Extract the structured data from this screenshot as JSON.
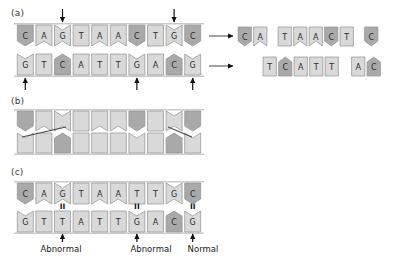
{
  "figure": {
    "panels": [
      {
        "id": "a",
        "label": "(a)"
      },
      {
        "id": "b",
        "label": "(b)"
      },
      {
        "id": "c",
        "label": "(c)"
      }
    ],
    "colors": {
      "tile_dark": "#a9a9a9",
      "tile_light": "#d9d9d9",
      "tile_stroke": "#8f8f8f",
      "backbone": "#c9c9c9",
      "arrow": "#111111",
      "text": "#1a1a1a"
    }
  },
  "panel_a": {
    "label": "(a)",
    "top_strand": {
      "bases": [
        "C",
        "A",
        "G",
        "T",
        "A",
        "A",
        "C",
        "T",
        "G",
        "C"
      ],
      "shades": [
        "dark",
        "light",
        "light",
        "light",
        "light",
        "light",
        "dark",
        "light",
        "light",
        "dark"
      ]
    },
    "bottom_strand": {
      "bases": [
        "G",
        "T",
        "C",
        "A",
        "T",
        "T",
        "G",
        "A",
        "C",
        "G"
      ],
      "shades": [
        "light",
        "light",
        "dark",
        "light",
        "light",
        "light",
        "light",
        "light",
        "dark",
        "light"
      ]
    },
    "top_arrows": {
      "count": 2,
      "glyph": "down-arrow",
      "positions": [
        2,
        8
      ]
    },
    "bottom_arrows": {
      "count": 3,
      "glyph": "up-arrow",
      "positions": [
        0,
        6,
        9
      ]
    },
    "transfer_arrows": {
      "count": 2,
      "glyph": "right-arrow"
    }
  },
  "panel_a_fragments": {
    "top_row": [
      {
        "bases": [
          "C",
          "A"
        ],
        "shades": [
          "dark",
          "light"
        ]
      },
      {
        "bases": [
          "T",
          "A",
          "A",
          "C",
          "T"
        ],
        "shades": [
          "light",
          "light",
          "light",
          "dark",
          "light"
        ]
      },
      {
        "bases": [
          "C"
        ],
        "shades": [
          "dark"
        ]
      }
    ],
    "bottom_row": [
      {
        "bases": [
          "T",
          "C",
          "A",
          "T",
          "T"
        ],
        "shades": [
          "light",
          "dark",
          "light",
          "light",
          "light"
        ]
      },
      {
        "bases": [
          "A",
          "C"
        ],
        "shades": [
          "light",
          "dark"
        ]
      }
    ]
  },
  "panel_b": {
    "label": "(b)",
    "top_strand": {
      "bases": [
        "",
        "",
        "",
        "",
        "",
        "",
        "",
        "",
        "",
        ""
      ],
      "shades": [
        "dark",
        "light",
        "light",
        "light",
        "light",
        "light",
        "dark",
        "light",
        "light",
        "dark"
      ]
    },
    "bottom_strand": {
      "bases": [
        "",
        "",
        "",
        "",
        "",
        "",
        "",
        "",
        "",
        ""
      ],
      "shades": [
        "light",
        "light",
        "dark",
        "light",
        "light",
        "light",
        "light",
        "light",
        "dark",
        "light"
      ]
    },
    "connectors": 2
  },
  "panel_c": {
    "label": "(c)",
    "top_strand": {
      "bases": [
        "C",
        "A",
        "G",
        "T",
        "A",
        "A",
        "T",
        "T",
        "G",
        "C"
      ],
      "shades": [
        "dark",
        "light",
        "light",
        "light",
        "light",
        "light",
        "light",
        "light",
        "light",
        "dark"
      ]
    },
    "bottom_strand": {
      "bases": [
        "G",
        "T",
        "T",
        "A",
        "T",
        "T",
        "G",
        "A",
        "C",
        "G"
      ],
      "shades": [
        "light",
        "light",
        "light",
        "light",
        "light",
        "light",
        "light",
        "light",
        "dark",
        "light"
      ]
    },
    "bond_marks": {
      "glyph": "double-bond",
      "symbol": "II",
      "positions": [
        2,
        6,
        9
      ]
    },
    "annotations": [
      {
        "label": "Abnormal",
        "position": 2,
        "glyph": "up-arrow"
      },
      {
        "label": "Abnormal",
        "position": 6,
        "glyph": "up-arrow"
      },
      {
        "label": "Normal",
        "position": 9,
        "glyph": "up-arrow"
      }
    ]
  }
}
